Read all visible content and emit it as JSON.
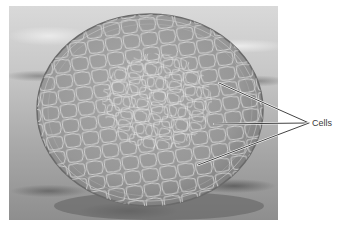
{
  "figure": {
    "type": "scanning electron micrograph",
    "colors": {
      "background": "#ffffff",
      "photo_light": "#d9d9d9",
      "photo_dark": "#8e8e8e",
      "sphere": "#9a9a9a",
      "cell_edge": "#e6e6e6",
      "leader_line": "#2e2e2e",
      "label_text": "#3a3a3a"
    },
    "callout": {
      "label": "Cells",
      "convergence_point": [
        309,
        123
      ],
      "leader_lines": [
        {
          "from": [
            219,
            83
          ],
          "to": [
            309,
            123
          ]
        },
        {
          "from": [
            214,
            124
          ],
          "to": [
            309,
            123
          ]
        },
        {
          "from": [
            198,
            165
          ],
          "to": [
            309,
            123
          ]
        }
      ]
    }
  }
}
